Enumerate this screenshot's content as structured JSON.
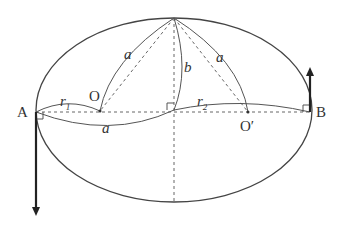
{
  "diagram": {
    "points": {
      "A": "A",
      "B": "B",
      "O": "O",
      "O_prime": "O′"
    },
    "segment_labels": {
      "a_left_upper": "a",
      "a_bottom": "a",
      "a_right_upper": "a",
      "b": "b",
      "r1": "r",
      "r1_sub": "1",
      "r2": "r",
      "r2_sub": "2"
    },
    "colors": {
      "line": "#444444",
      "arrow": "#222222",
      "dashed": "#666666"
    }
  }
}
